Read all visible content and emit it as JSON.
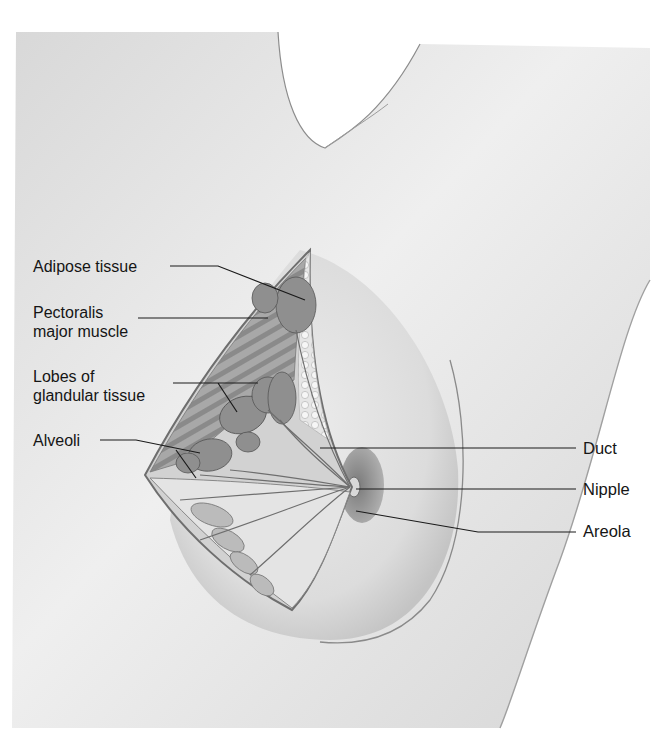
{
  "figure": {
    "colors": {
      "background": "#ffffff",
      "skin": "#e4e4e4",
      "skin_shadow": "#c6c6c6",
      "muscle": "#9a9a9a",
      "glandular": "#7a7a7a",
      "adipose": "#ececec",
      "areola": "#8c8c8c",
      "leader_line": "#1a1a1a",
      "text": "#151515"
    }
  },
  "labels": {
    "left": [
      {
        "id": "adipose",
        "text": "Adipose tissue"
      },
      {
        "id": "pectoralis",
        "text": "Pectoralis\nmajor muscle"
      },
      {
        "id": "lobes",
        "text": "Lobes of\nglandular tissue"
      },
      {
        "id": "alveoli",
        "text": "Alveoli"
      }
    ],
    "right": [
      {
        "id": "duct",
        "text": "Duct"
      },
      {
        "id": "nipple",
        "text": "Nipple"
      },
      {
        "id": "areola",
        "text": "Areola"
      }
    ]
  }
}
